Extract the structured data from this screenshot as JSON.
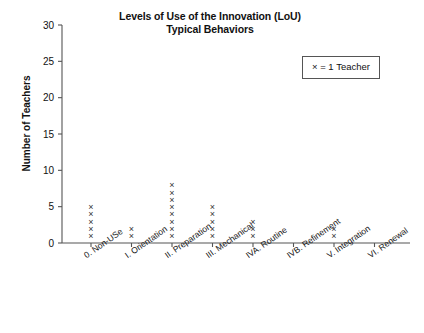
{
  "chart_data": {
    "type": "scatter",
    "plot_style": "dot-plot-stacked-x-markers",
    "title": "Levels of Use of the Innovation (LoU) Typical Behaviors",
    "title_lines": [
      "Levels of Use of the Innovation (LoU)",
      "Typical Behaviors"
    ],
    "xlabel": "",
    "ylabel": "Number of Teachers",
    "ylim": [
      0,
      30
    ],
    "yticks": [
      0,
      5,
      10,
      15,
      20,
      25,
      30
    ],
    "ytick_labels": [
      "0",
      "5",
      "10",
      "15",
      "20",
      "25",
      "30"
    ],
    "grid": false,
    "legend_position": "upper-right",
    "legend_entries": [
      "× = 1 Teacher"
    ],
    "marker_glyph": "×",
    "marker_unit_value": 1,
    "categories": [
      "0. Non-USe",
      "I. Orientation",
      "II. Preparation",
      "III. Mechanical",
      "IVA. Routine",
      "IVB. Refinement",
      "V. Integration",
      "VI. Renewal"
    ],
    "values": [
      5,
      2,
      8,
      5,
      3,
      0,
      2,
      0
    ],
    "series": [
      {
        "name": "Number of Teachers",
        "values": [
          5,
          2,
          8,
          5,
          3,
          0,
          2,
          0
        ]
      }
    ]
  },
  "legend": {
    "text": "× = 1 Teacher"
  },
  "axis": {
    "y_title": "Number of Teachers"
  },
  "colors": {
    "axis": "#555555",
    "marker": "#333333",
    "text": "#111111",
    "background": "#ffffff"
  }
}
